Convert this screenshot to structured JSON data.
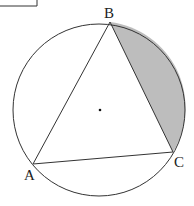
{
  "figure": {
    "type": "inscribed-triangle-in-circle",
    "circle": {
      "cx": 99,
      "cy": 110,
      "r": 86,
      "center_marked": true
    },
    "vertices": {
      "A": {
        "label": "A",
        "x": 33,
        "y": 164
      },
      "B": {
        "label": "B",
        "x": 110,
        "y": 22
      },
      "C": {
        "label": "C",
        "x": 173,
        "y": 152
      }
    },
    "shaded_region": {
      "description": "circular segment between chord BC and arc BC",
      "color": "#bdbdbd"
    },
    "stroke_color": "#333333",
    "corner_box": {
      "visible": true
    }
  },
  "labels": {
    "A": "A",
    "B": "B",
    "C": "C"
  }
}
